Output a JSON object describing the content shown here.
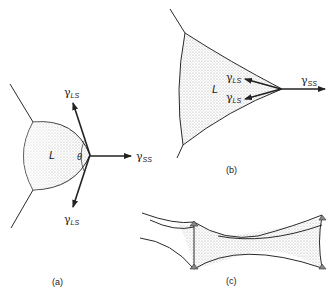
{
  "figure": {
    "panels": [
      {
        "id": "a",
        "label": "(a)"
      },
      {
        "id": "b",
        "label": "(b)"
      },
      {
        "id": "c",
        "label": "(c)"
      }
    ],
    "symbols": {
      "gamma": "γ",
      "ls_sub": "LS",
      "ss_sub": "SS",
      "liquid": "L",
      "theta": "θ"
    },
    "colors": {
      "line": "#2a2a2a",
      "stipple": "#b8b8b8",
      "background": "#ffffff"
    }
  }
}
